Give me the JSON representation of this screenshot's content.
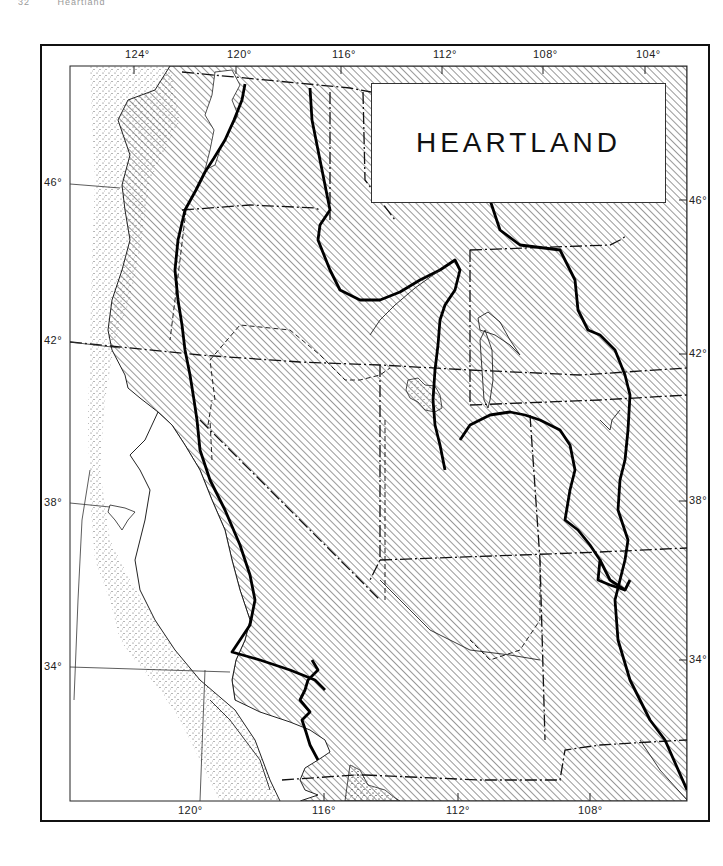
{
  "page_header": {
    "page_number": "32",
    "running_title": "Heartland"
  },
  "map": {
    "title": "HEARTLAND",
    "colors": {
      "frame": "#111111",
      "hatch": "#333333",
      "stipple": "#555555",
      "background": "#ffffff"
    },
    "longitude_labels_top": [
      "124°",
      "120°",
      "116°",
      "112°",
      "108°",
      "104°"
    ],
    "longitude_labels_bottom": [
      "120°",
      "116°",
      "112°",
      "108°"
    ],
    "latitude_labels_left": [
      "46°",
      "42°",
      "38°",
      "34°"
    ],
    "latitude_labels_right": [
      "46°",
      "42°",
      "38°",
      "34°"
    ],
    "legend_items": [
      {
        "pattern": "diagonal-hatch",
        "meaning": "land"
      },
      {
        "pattern": "stipple",
        "meaning": "continental shelf / shallow water"
      }
    ],
    "line_styles": [
      "thick solid boundary (Heartland region)",
      "dash-dot state boundaries",
      "dashed inner boundaries",
      "thin solid coastline"
    ]
  }
}
